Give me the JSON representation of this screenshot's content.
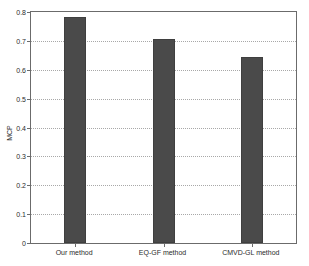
{
  "chart_data": {
    "type": "bar",
    "title": "",
    "xlabel": "",
    "ylabel": "MCP",
    "categories": [
      "Our method",
      "EQ-GF method",
      "CMVD-GL method"
    ],
    "values": [
      0.783,
      0.707,
      0.645
    ],
    "ylim": [
      0,
      0.8
    ],
    "xlim": [
      0,
      3
    ],
    "ytick_labels": [
      "0",
      "0.1",
      "0.2",
      "0.3",
      "0.4",
      "0.5",
      "0.6",
      "0.7",
      "0.8"
    ],
    "ytick_values": [
      0,
      0.1,
      0.2,
      0.3,
      0.4,
      0.5,
      0.6,
      0.7,
      0.8
    ],
    "grid": "horizontal-dotted",
    "legend": "none",
    "bar_color": "#4a4a4a",
    "bar_edge_color": "#3f3f3f",
    "axis_color": "#6b6b6b",
    "grid_color": "#9a9a9a",
    "background_color": "#ffffff",
    "series": [
      {
        "name": "MCP",
        "values": [
          0.783,
          0.707,
          0.645
        ]
      }
    ]
  }
}
